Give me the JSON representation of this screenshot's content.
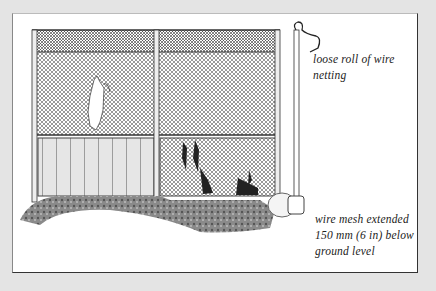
{
  "figure": {
    "colors": {
      "background": "#e4e4e4",
      "card": "#ffffff",
      "ink": "#222222"
    }
  },
  "labels": {
    "top": {
      "line1": "loose roll of wire",
      "line2": "netting"
    },
    "bottom": {
      "line1": "wire mesh extended",
      "line2": "150 mm (6 in) below",
      "line3": "ground level"
    }
  }
}
